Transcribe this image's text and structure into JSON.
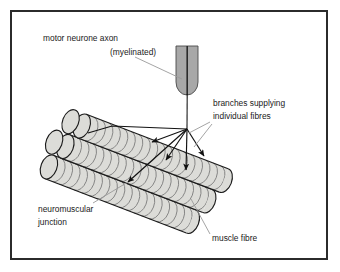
{
  "figure": {
    "border_color": "#2b2b2b",
    "background_color": "#ffffff"
  },
  "colors": {
    "outline": "#1a1a1a",
    "fibre_fill": "#dcdcd8",
    "fibre_stripe": "#6e6e6e",
    "axon_sheath": "#a8a8a8",
    "axon_core": "#2b2b2b",
    "leader_line": "#9a9a9a",
    "branch_line": "#111111",
    "text": "#1a1a1a"
  },
  "labels": [
    {
      "id": "motor-neurone-axon",
      "line1": "motor neurone axon",
      "line2": "(myelinated)",
      "x1": 43,
      "y1": 41,
      "x2": 110,
      "y2": 55,
      "align": "start",
      "leader_from_x": 135,
      "leader_from_y": 57,
      "leader_to_x": 182,
      "leader_to_y": 79
    },
    {
      "id": "branches-supplying-individual-fibres",
      "line1": "branches supplying",
      "line2": "individual fibres",
      "x1": 213,
      "y1": 106,
      "x2": 213,
      "y2": 119,
      "align": "start",
      "leader_from_x": 210,
      "leader_from_y": 122,
      "leader_to_x": 189,
      "leader_to_y": 133
    },
    {
      "id": "neuromuscular-junction",
      "line1": "neuromuscular",
      "line2": "junction",
      "x1": 38,
      "y1": 212,
      "x2": 38,
      "y2": 225,
      "align": "start",
      "leader_from_x": 93,
      "leader_from_y": 203,
      "leader_to_x": 128,
      "leader_to_y": 182
    },
    {
      "id": "muscle-fibre",
      "line1": "muscle fibre",
      "line2": "",
      "x1": 212,
      "y1": 241,
      "x2": 212,
      "y2": 254,
      "align": "start",
      "leader_from_x": 210,
      "leader_from_y": 234,
      "leader_to_x": 191,
      "leader_to_y": 199
    }
  ],
  "axon": {
    "name": "motor neurone axon",
    "sheath_left": 176,
    "sheath_top": 48,
    "sheath_width": 22,
    "sheath_height": 47,
    "core_x": 187,
    "core_top": 48,
    "terminal_x": 187,
    "terminal_y": 129
  },
  "muscle_bundle": {
    "name": "bundle of muscle fibres",
    "rows": 3,
    "fibres_per_row": 2,
    "segment_count": 18,
    "angle_deg": 21
  },
  "branches": [
    {
      "id": "branch-1",
      "to_x": 152,
      "to_y": 142
    },
    {
      "id": "branch-2",
      "to_x": 166,
      "to_y": 160
    },
    {
      "id": "branch-3",
      "to_x": 186,
      "to_y": 170
    },
    {
      "id": "branch-4",
      "to_x": 204,
      "to_y": 156
    },
    {
      "id": "branch-5",
      "to_x": 128,
      "to_y": 182
    }
  ],
  "extra_branch": {
    "id": "branch-left-upper",
    "from_x": 187,
    "from_y": 129,
    "mid_x": 112,
    "mid_y": 126,
    "to_x": 88,
    "to_y": 133
  }
}
